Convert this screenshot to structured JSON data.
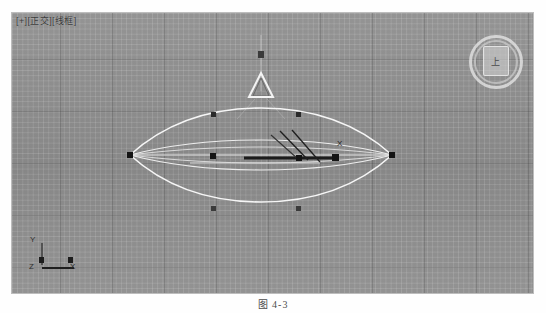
{
  "app": {
    "name": "3ds Max viewport",
    "viewport_label": "[+][正交][线框]"
  },
  "view_cube": {
    "face_label": "上",
    "name": "view-cube"
  },
  "axis_tripod": {
    "y": "Y",
    "z": "Z",
    "x": "X"
  },
  "scene": {
    "object_name": "lens-wireframe",
    "gizmo_name": "cone-light-gizmo",
    "selection_label": "X"
  },
  "caption": {
    "text": "图 4-3"
  },
  "colors": {
    "viewport_bg": "#8e8e8e",
    "wireframe": "#f2f2f2",
    "vertex": "#1d1d1d",
    "selection": "#1a1a1a",
    "grid_fine": "rgba(255,255,255,0.13)",
    "grid_major": "rgba(40,40,40,0.20)"
  }
}
